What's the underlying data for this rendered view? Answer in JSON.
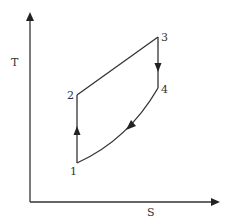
{
  "diagram": {
    "type": "T-S diagram",
    "axes": {
      "x_label": "S",
      "y_label": "T"
    },
    "points": [
      {
        "id": "1",
        "label": "1"
      },
      {
        "id": "2",
        "label": "2"
      },
      {
        "id": "3",
        "label": "3"
      },
      {
        "id": "4",
        "label": "4"
      }
    ],
    "processes": [
      {
        "from": "1",
        "to": "2",
        "shape": "vertical line",
        "direction": "up"
      },
      {
        "from": "2",
        "to": "3",
        "shape": "straight line",
        "direction": "up-right"
      },
      {
        "from": "3",
        "to": "4",
        "shape": "vertical line",
        "direction": "down"
      },
      {
        "from": "4",
        "to": "1",
        "shape": "curve",
        "direction": "down-left"
      }
    ],
    "colors": {
      "line": "#333333",
      "background": "#ffffff"
    }
  }
}
